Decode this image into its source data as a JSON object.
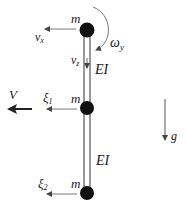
{
  "diagram": {
    "type": "beam-mass-model",
    "colors": {
      "mass": "#111111",
      "beam": "#333333",
      "arrow": "#333333",
      "thin_arrow": "#555555",
      "text": "#222222",
      "background": "#ffffff"
    },
    "masses": [
      {
        "label": "m",
        "position": "top"
      },
      {
        "label": "m",
        "position": "middle"
      },
      {
        "label": "m",
        "position": "bottom"
      }
    ],
    "beams": [
      {
        "label": "EI",
        "segment": "upper"
      },
      {
        "label": "EI",
        "segment": "lower"
      }
    ],
    "labels": {
      "omega": "ω",
      "omega_sub": "y",
      "vx": "v",
      "vx_sub": "x",
      "vz": "v",
      "vz_sub": "z",
      "V": "V",
      "xi1": "ξ",
      "xi1_sub": "1",
      "xi2": "ξ",
      "xi2_sub": "2",
      "g": "g",
      "m_top": "m",
      "m_mid": "m",
      "m_bot": "m",
      "ei_upper": "EI",
      "ei_lower": "EI"
    }
  }
}
